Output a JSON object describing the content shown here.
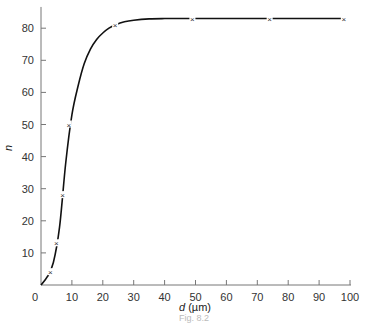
{
  "chart_data": {
    "type": "line",
    "title": "",
    "xlabel": "d (µm)",
    "xlabel_italic_part": "d",
    "xlabel_unit": "(µm)",
    "ylabel": "n",
    "xlim": [
      0,
      100
    ],
    "ylim": [
      0,
      86
    ],
    "xticks": [
      0,
      10,
      20,
      30,
      40,
      50,
      60,
      70,
      80,
      90,
      100
    ],
    "yticks": [
      10,
      20,
      30,
      40,
      50,
      60,
      70,
      80
    ],
    "grid": false,
    "legend": null,
    "series": [
      {
        "name": "n vs d",
        "marker": "x",
        "x": [
          0,
          3,
          5,
          7,
          9,
          24,
          49,
          74,
          98
        ],
        "y": [
          0,
          4,
          13,
          28,
          50,
          81,
          83,
          83,
          83
        ]
      }
    ],
    "curve": {
      "x": [
        0,
        2,
        4,
        6,
        8,
        10,
        12,
        14,
        16,
        18,
        20,
        22,
        24,
        27,
        30,
        35,
        40,
        45,
        49,
        60,
        74,
        85,
        98
      ],
      "y": [
        0,
        2.5,
        7,
        18,
        38,
        53,
        62,
        69,
        73.5,
        76.5,
        78.5,
        80,
        81,
        82,
        82.5,
        82.9,
        83,
        83,
        83,
        83,
        83,
        83,
        83
      ]
    }
  },
  "caption": "Fig. 8.2"
}
